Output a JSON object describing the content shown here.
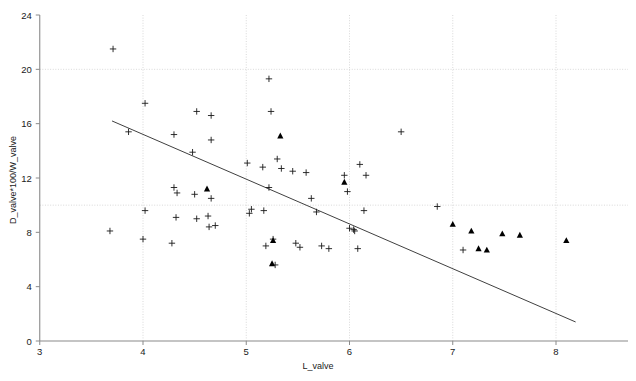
{
  "chart_data": {
    "type": "scatter",
    "title": "",
    "xlabel": "L_valve",
    "ylabel": "D_valve*100/W_valve",
    "xlim": [
      3,
      8.5
    ],
    "ylim": [
      0,
      24
    ],
    "xticks": [
      3,
      4,
      5,
      6,
      7,
      8
    ],
    "yticks": [
      0,
      4,
      8,
      12,
      16,
      20,
      24
    ],
    "xtick_labels": [
      "3",
      "4",
      "5",
      "6",
      "7",
      "8"
    ],
    "ytick_labels": [
      "0",
      "4",
      "8",
      "12",
      "16",
      "20",
      "24"
    ],
    "grid": {
      "vertical_at": [
        4,
        5,
        6,
        7,
        8
      ],
      "horizontal_at": [
        10,
        20
      ],
      "color": "#cfcfcf",
      "style": "dotted"
    },
    "legend": {
      "position": "none",
      "entries": []
    },
    "series": [
      {
        "name": "cross-markers",
        "marker": "plus",
        "color": "#1a1a1a",
        "points": [
          [
            3.71,
            21.5
          ],
          [
            3.68,
            8.1
          ],
          [
            3.86,
            15.4
          ],
          [
            4.02,
            17.5
          ],
          [
            4.02,
            9.6
          ],
          [
            4.0,
            7.5
          ],
          [
            4.3,
            11.3
          ],
          [
            4.3,
            15.2
          ],
          [
            4.33,
            10.9
          ],
          [
            4.32,
            9.1
          ],
          [
            4.28,
            7.2
          ],
          [
            4.48,
            13.9
          ],
          [
            4.52,
            16.9
          ],
          [
            4.5,
            10.8
          ],
          [
            4.52,
            9.0
          ],
          [
            4.66,
            16.6
          ],
          [
            4.66,
            14.8
          ],
          [
            4.66,
            10.5
          ],
          [
            4.63,
            9.2
          ],
          [
            4.64,
            8.4
          ],
          [
            4.7,
            8.5
          ],
          [
            5.01,
            13.1
          ],
          [
            5.05,
            9.7
          ],
          [
            5.03,
            9.4
          ],
          [
            5.16,
            12.8
          ],
          [
            5.17,
            9.6
          ],
          [
            5.19,
            7.0
          ],
          [
            5.22,
            19.3
          ],
          [
            5.24,
            16.9
          ],
          [
            5.22,
            11.3
          ],
          [
            5.26,
            7.5
          ],
          [
            5.28,
            5.6
          ],
          [
            5.3,
            13.4
          ],
          [
            5.34,
            12.7
          ],
          [
            5.45,
            12.5
          ],
          [
            5.48,
            7.2
          ],
          [
            5.52,
            6.9
          ],
          [
            5.58,
            12.4
          ],
          [
            5.63,
            10.5
          ],
          [
            5.68,
            9.5
          ],
          [
            5.73,
            7.0
          ],
          [
            5.8,
            6.8
          ],
          [
            5.95,
            12.2
          ],
          [
            5.98,
            11.0
          ],
          [
            6.0,
            8.3
          ],
          [
            6.04,
            8.2
          ],
          [
            6.05,
            8.1
          ],
          [
            6.08,
            6.8
          ],
          [
            6.1,
            13.0
          ],
          [
            6.14,
            9.6
          ],
          [
            6.16,
            12.2
          ],
          [
            6.5,
            15.4
          ],
          [
            6.85,
            9.9
          ],
          [
            7.1,
            6.7
          ]
        ]
      },
      {
        "name": "triangle-markers",
        "marker": "triangle",
        "color": "#000000",
        "points": [
          [
            4.62,
            11.2
          ],
          [
            5.33,
            15.1
          ],
          [
            5.26,
            7.4
          ],
          [
            5.25,
            5.7
          ],
          [
            5.95,
            11.7
          ],
          [
            7.0,
            8.6
          ],
          [
            7.18,
            8.1
          ],
          [
            7.25,
            6.8
          ],
          [
            7.33,
            6.7
          ],
          [
            7.48,
            7.9
          ],
          [
            7.65,
            7.8
          ],
          [
            8.1,
            7.4
          ]
        ]
      }
    ],
    "trendline": {
      "name": "regression-line",
      "color": "#404040",
      "x_start": 3.7,
      "y_start": 16.2,
      "x_end": 8.19,
      "y_end": 1.4
    }
  }
}
